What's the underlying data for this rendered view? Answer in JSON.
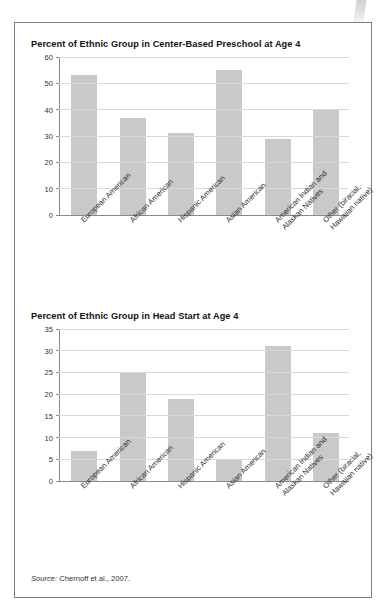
{
  "figure": {
    "source_prefix": "Source:",
    "source_text": " Chernoff et al., 2007."
  },
  "colors": {
    "bar_fill": "#c9c9c9",
    "gridline": "#d8d8d8",
    "axis": "#8a8a8a",
    "border": "#7d7d7d",
    "text": "#1a1a1a"
  },
  "categories": [
    {
      "line1": "European American",
      "line2": ""
    },
    {
      "line1": "African American",
      "line2": ""
    },
    {
      "line1": "Hispanic American",
      "line2": ""
    },
    {
      "line1": "Asian American",
      "line2": ""
    },
    {
      "line1": "American Indian and",
      "line2": "Alaskan Natives"
    },
    {
      "line1": "Other (biracial,",
      "line2": "Hawaiian native)"
    }
  ],
  "chart_data": [
    {
      "type": "bar",
      "title": "Percent of Ethnic Group in Center-Based Preschool at Age 4",
      "xlabel": "",
      "ylabel": "",
      "ylim": [
        0,
        60
      ],
      "yticks": [
        0,
        10,
        20,
        30,
        40,
        50,
        60
      ],
      "ytick_labels": [
        "0",
        "10",
        "20",
        "30",
        "40",
        "50",
        "60"
      ],
      "grid": true,
      "legend": "none",
      "categories": [
        "European American",
        "African American",
        "Hispanic American",
        "Asian American",
        "American Indian and Alaskan Natives",
        "Other (biracial, Hawaiian native)"
      ],
      "values": [
        53,
        37,
        31,
        55,
        29,
        40
      ]
    },
    {
      "type": "bar",
      "title": "Percent of Ethnic Group in Head Start at Age 4",
      "xlabel": "",
      "ylabel": "",
      "ylim": [
        0,
        35
      ],
      "yticks": [
        0,
        5,
        10,
        15,
        20,
        25,
        30,
        35
      ],
      "ytick_labels": [
        "0",
        "5",
        "10",
        "15",
        "20",
        "25",
        "30",
        "35"
      ],
      "grid": true,
      "legend": "none",
      "categories": [
        "European American",
        "African American",
        "Hispanic American",
        "Asian American",
        "American Indian and Alaskan Natives",
        "Other (biracial, Hawaiian native)"
      ],
      "values": [
        7,
        25,
        19,
        5,
        31,
        11
      ]
    }
  ]
}
